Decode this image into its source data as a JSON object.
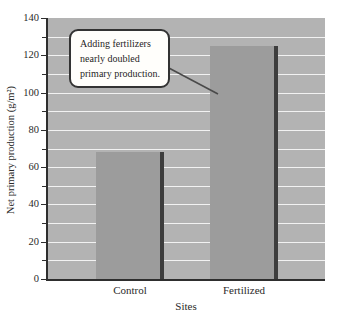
{
  "chart_data": {
    "type": "bar",
    "title": "",
    "xlabel": "Sites",
    "ylabel": "Net primary production (g/m²)",
    "categories": [
      "Control",
      "Fertilized"
    ],
    "values": [
      68,
      125
    ],
    "ylim": [
      0,
      140
    ],
    "y_ticks": [
      0,
      20,
      40,
      60,
      80,
      100,
      120,
      140
    ],
    "minor_tick_step": 10,
    "grid_step": 10,
    "grid": true,
    "legend": false,
    "annotation": {
      "lines": [
        "Adding fertilizers",
        "nearly doubled",
        "primary production."
      ]
    },
    "colors": {
      "plot_background": "#b3b3b3",
      "bar_fill": "#9c9c9c",
      "bar_shadow": "#3d3d3d",
      "gridline": "#f2f2f2",
      "axis": "#2e2e2e",
      "text": "#2a2a2a",
      "callout_background": "#fffefb",
      "callout_border": "#333333",
      "leader_line": "#4a4a4a"
    }
  }
}
